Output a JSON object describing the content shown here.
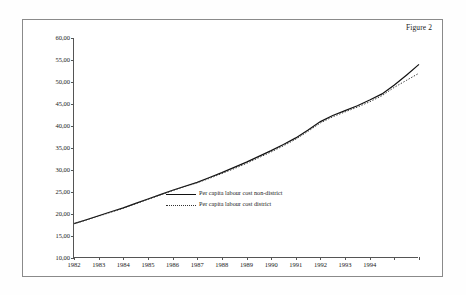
{
  "figure": {
    "caption": "Figure 2"
  },
  "chart_data": {
    "type": "line",
    "title": "Figure 2",
    "xlabel": "",
    "ylabel": "",
    "grid": false,
    "legend_position": "inside-center-bottom",
    "xlim": [
      1982,
      1996
    ],
    "ylim": [
      10.0,
      60.0
    ],
    "ytick_labels": [
      "60,00",
      "55,00",
      "50,00",
      "45,00",
      "40,00",
      "35,00",
      "30,00",
      "25,00",
      "20,00",
      "15,00",
      "10,00"
    ],
    "ytick_values": [
      60,
      55,
      50,
      45,
      40,
      35,
      30,
      25,
      20,
      15,
      10
    ],
    "xtick_labels": [
      "1982",
      "1983",
      "1984",
      "1985",
      "1986",
      "1987",
      "1988",
      "1989",
      "1990",
      "1991",
      "1992",
      "1993",
      "1994"
    ],
    "xtick_values": [
      1982,
      1983,
      1984,
      1985,
      1986,
      1987,
      1988,
      1989,
      1990,
      1991,
      1992,
      1993,
      1994
    ],
    "x": [
      1982,
      1982.5,
      1983,
      1983.5,
      1984,
      1984.5,
      1985,
      1985.5,
      1986,
      1986.5,
      1987,
      1987.5,
      1988,
      1988.5,
      1989,
      1989.5,
      1990,
      1990.5,
      1991,
      1991.5,
      1992,
      1992.5,
      1993,
      1993.5,
      1994,
      1994.5,
      1995,
      1995.5,
      1996
    ],
    "series": [
      {
        "name": "Per capita labour cost non-district",
        "style": "solid",
        "color": "#111111",
        "values": [
          17.8,
          18.6,
          19.5,
          20.4,
          21.3,
          22.2,
          23.1,
          24.0,
          25.0,
          25.9,
          26.8,
          27.8,
          28.9,
          30.0,
          31.2,
          32.4,
          33.6,
          34.8,
          36.0,
          37.2,
          38.4,
          39.6,
          40.9,
          42.4,
          43.3,
          44.3,
          45.4,
          46.5,
          47.6
        ]
      },
      {
        "name": "Per capita labour cost district",
        "style": "dotted",
        "color": "#333333",
        "values": [
          17.8,
          18.6,
          19.4,
          20.3,
          21.2,
          22.1,
          23.0,
          23.9,
          24.9,
          25.8,
          26.7,
          27.6,
          28.7,
          29.8,
          31.0,
          32.1,
          33.3,
          34.5,
          35.7,
          36.9,
          38.1,
          39.3,
          40.6,
          42.1,
          43.0,
          44.0,
          45.0,
          46.1,
          47.2
        ]
      }
    ],
    "series_full": [
      {
        "name": "Per capita labour cost non-district",
        "style": "solid",
        "points": [
          [
            1982.0,
            17.8
          ],
          [
            1982.5,
            18.7
          ],
          [
            1983.0,
            19.6
          ],
          [
            1983.5,
            20.5
          ],
          [
            1984.0,
            21.4
          ],
          [
            1984.5,
            22.4
          ],
          [
            1985.0,
            23.4
          ],
          [
            1985.5,
            24.4
          ],
          [
            1986.0,
            25.4
          ],
          [
            1986.5,
            26.3
          ],
          [
            1987.0,
            27.2
          ],
          [
            1987.5,
            28.3
          ],
          [
            1988.0,
            29.4
          ],
          [
            1988.5,
            30.6
          ],
          [
            1989.0,
            31.8
          ],
          [
            1989.5,
            33.1
          ],
          [
            1990.0,
            34.4
          ],
          [
            1990.5,
            35.8
          ],
          [
            1991.0,
            37.3
          ],
          [
            1991.5,
            39.1
          ],
          [
            1992.0,
            41.0
          ],
          [
            1992.5,
            42.4
          ],
          [
            1993.0,
            43.5
          ],
          [
            1993.5,
            44.6
          ],
          [
            1994.0,
            45.9
          ],
          [
            1994.5,
            47.3
          ],
          [
            1995.0,
            49.3
          ],
          [
            1995.5,
            51.6
          ],
          [
            1996.0,
            54.0
          ]
        ]
      },
      {
        "name": "Per capita labour cost district",
        "style": "dotted",
        "points": [
          [
            1982.0,
            17.8
          ],
          [
            1982.5,
            18.6
          ],
          [
            1983.0,
            19.5
          ],
          [
            1983.5,
            20.4
          ],
          [
            1984.0,
            21.3
          ],
          [
            1984.5,
            22.3
          ],
          [
            1985.0,
            23.3
          ],
          [
            1985.5,
            24.3
          ],
          [
            1986.0,
            25.3
          ],
          [
            1986.5,
            26.2
          ],
          [
            1987.0,
            27.1
          ],
          [
            1987.5,
            28.1
          ],
          [
            1988.0,
            29.2
          ],
          [
            1988.5,
            30.3
          ],
          [
            1989.0,
            31.5
          ],
          [
            1989.5,
            32.8
          ],
          [
            1990.0,
            34.1
          ],
          [
            1990.5,
            35.5
          ],
          [
            1991.0,
            37.0
          ],
          [
            1991.5,
            38.8
          ],
          [
            1992.0,
            40.7
          ],
          [
            1992.5,
            42.1
          ],
          [
            1993.0,
            43.2
          ],
          [
            1993.5,
            44.3
          ],
          [
            1994.0,
            45.5
          ],
          [
            1994.5,
            46.9
          ],
          [
            1995.0,
            48.8
          ],
          [
            1995.5,
            50.4
          ],
          [
            1996.0,
            52.0
          ]
        ]
      }
    ]
  },
  "legend": {
    "items": [
      {
        "label": "Per capita labour cost non-district",
        "style": "solid"
      },
      {
        "label": "Per capita labour cost district",
        "style": "dotted"
      }
    ]
  }
}
